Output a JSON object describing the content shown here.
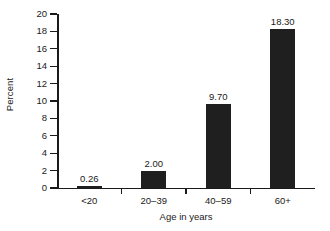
{
  "chart_data": {
    "type": "bar",
    "title": "",
    "xlabel": "Age in years",
    "ylabel": "Percent",
    "categories": [
      "<20",
      "20–39",
      "40–59",
      "60+"
    ],
    "values": [
      0.26,
      2.0,
      9.7,
      18.3
    ],
    "value_labels": [
      "0.26",
      "2.00",
      "9.70",
      "18.30"
    ],
    "ylim": [
      0,
      20
    ],
    "yticks": [
      0,
      2,
      4,
      6,
      8,
      10,
      12,
      14,
      16,
      18,
      20
    ],
    "ytick_labels": [
      "0",
      "2",
      "4",
      "6",
      "8",
      "10",
      "12",
      "14",
      "16",
      "18",
      "20"
    ],
    "grid": false,
    "legend": null,
    "bar_color": "#1f1f1f",
    "axis_color": "#1a1a1a",
    "background_color": "#ffffff"
  }
}
